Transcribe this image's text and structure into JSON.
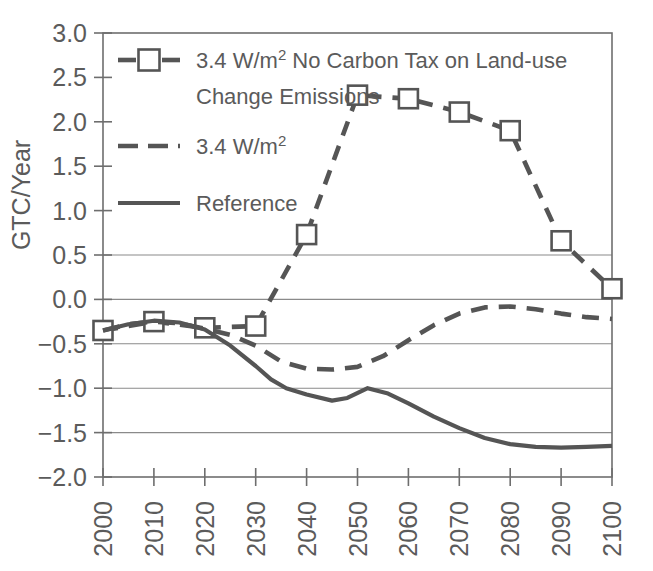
{
  "chart_data": {
    "type": "line",
    "title": "",
    "xlabel": "",
    "ylabel": "GTC/Year",
    "xlim": [
      2000,
      2100
    ],
    "ylim": [
      -2.0,
      3.0
    ],
    "grid": true,
    "legend_position": "top-left",
    "x": [
      2000,
      2010,
      2020,
      2030,
      2040,
      2050,
      2060,
      2070,
      2080,
      2090,
      2100
    ],
    "xtick_labels": [
      "2000",
      "2010",
      "2020",
      "2030",
      "2040",
      "2050",
      "2060",
      "2070",
      "2080",
      "2090",
      "2100"
    ],
    "ytick_labels": [
      "3.0",
      "2.5",
      "2.0",
      "1.5",
      "1.0",
      "0.5",
      "0.0",
      "−0.5",
      "−1.0",
      "−1.5",
      "−2.0"
    ],
    "ytick_values": [
      3.0,
      2.5,
      2.0,
      1.5,
      1.0,
      0.5,
      0.0,
      -0.5,
      -1.0,
      -1.5,
      -2.0
    ],
    "gridline_values": [
      0.5,
      0.0,
      -0.5,
      -1.0,
      -1.5
    ],
    "series": [
      {
        "name": "3.4 W/m2 No Carbon Tax on Land-use Change Emissions",
        "legend_line1": "3.4 W/m",
        "legend_sup1": "2",
        "legend_line1_rest": " No Carbon Tax on Land-use",
        "legend_line2": "Change Emissions",
        "style": "dashed-square",
        "color": "#555555",
        "marker": "square",
        "values": [
          -0.35,
          -0.25,
          -0.32,
          -0.3,
          0.73,
          2.3,
          2.26,
          2.11,
          1.9,
          0.66,
          0.12
        ]
      },
      {
        "name": "3.4 W/m2",
        "legend_line1": "3.4 W/m",
        "legend_sup1": "2",
        "legend_line1_rest": "",
        "legend_line2": "",
        "style": "dashed",
        "color": "#555555",
        "marker": "none",
        "values": [
          -0.35,
          -0.25,
          -0.32,
          -0.45,
          -0.78,
          -0.75,
          -0.5,
          -0.12,
          -0.09,
          -0.15,
          -0.22
        ]
      },
      {
        "name": "Reference",
        "legend_line1": "Reference",
        "legend_sup1": "",
        "legend_line1_rest": "",
        "legend_line2": "",
        "style": "solid",
        "color": "#555555",
        "marker": "none",
        "values": [
          -0.35,
          -0.24,
          -0.33,
          -1.0,
          -1.13,
          -1.0,
          -1.24,
          -1.48,
          -1.63,
          -1.66,
          -1.65
        ]
      }
    ],
    "series_detail": [
      {
        "name": "3.4 W/m2 No Carbon Tax on Land-use Change Emissions",
        "points": [
          {
            "x": 2000,
            "y": -0.35
          },
          {
            "x": 2010,
            "y": -0.25
          },
          {
            "x": 2020,
            "y": -0.32
          },
          {
            "x": 2030,
            "y": -0.3
          },
          {
            "x": 2040,
            "y": 0.73
          },
          {
            "x": 2050,
            "y": 2.3
          },
          {
            "x": 2060,
            "y": 2.26
          },
          {
            "x": 2070,
            "y": 2.11
          },
          {
            "x": 2080,
            "y": 1.9
          },
          {
            "x": 2090,
            "y": 0.66
          },
          {
            "x": 2100,
            "y": 0.12
          }
        ]
      },
      {
        "name": "3.4 W/m2",
        "points": [
          {
            "x": 2000,
            "y": -0.35
          },
          {
            "x": 2005,
            "y": -0.28
          },
          {
            "x": 2010,
            "y": -0.25
          },
          {
            "x": 2015,
            "y": -0.27
          },
          {
            "x": 2020,
            "y": -0.33
          },
          {
            "x": 2025,
            "y": -0.4
          },
          {
            "x": 2030,
            "y": -0.52
          },
          {
            "x": 2035,
            "y": -0.7
          },
          {
            "x": 2040,
            "y": -0.78
          },
          {
            "x": 2045,
            "y": -0.79
          },
          {
            "x": 2050,
            "y": -0.76
          },
          {
            "x": 2055,
            "y": -0.64
          },
          {
            "x": 2060,
            "y": -0.46
          },
          {
            "x": 2065,
            "y": -0.29
          },
          {
            "x": 2070,
            "y": -0.16
          },
          {
            "x": 2075,
            "y": -0.09
          },
          {
            "x": 2080,
            "y": -0.08
          },
          {
            "x": 2085,
            "y": -0.11
          },
          {
            "x": 2090,
            "y": -0.16
          },
          {
            "x": 2095,
            "y": -0.2
          },
          {
            "x": 2100,
            "y": -0.22
          }
        ]
      },
      {
        "name": "Reference",
        "points": [
          {
            "x": 2000,
            "y": -0.35
          },
          {
            "x": 2005,
            "y": -0.28
          },
          {
            "x": 2010,
            "y": -0.24
          },
          {
            "x": 2015,
            "y": -0.26
          },
          {
            "x": 2020,
            "y": -0.34
          },
          {
            "x": 2025,
            "y": -0.52
          },
          {
            "x": 2030,
            "y": -0.75
          },
          {
            "x": 2033,
            "y": -0.9
          },
          {
            "x": 2036,
            "y": -1.0
          },
          {
            "x": 2040,
            "y": -1.07
          },
          {
            "x": 2045,
            "y": -1.14
          },
          {
            "x": 2048,
            "y": -1.11
          },
          {
            "x": 2052,
            "y": -1.0
          },
          {
            "x": 2056,
            "y": -1.06
          },
          {
            "x": 2060,
            "y": -1.17
          },
          {
            "x": 2065,
            "y": -1.32
          },
          {
            "x": 2070,
            "y": -1.45
          },
          {
            "x": 2075,
            "y": -1.56
          },
          {
            "x": 2080,
            "y": -1.63
          },
          {
            "x": 2085,
            "y": -1.66
          },
          {
            "x": 2090,
            "y": -1.67
          },
          {
            "x": 2095,
            "y": -1.66
          },
          {
            "x": 2100,
            "y": -1.65
          }
        ]
      }
    ]
  },
  "axis": {
    "y_label": "GTC/Year"
  },
  "legend": {
    "entries": [
      {
        "key": "no-carbon-tax",
        "line1_pre": "3.4 W/m",
        "line1_sup": "2",
        "line1_post": " No Carbon Tax on Land-use",
        "line2": "Change Emissions",
        "swatch": "dashed-square"
      },
      {
        "key": "3p4-wm2",
        "line1_pre": "3.4 W/m",
        "line1_sup": "2",
        "line1_post": "",
        "line2": "",
        "swatch": "dashed"
      },
      {
        "key": "reference",
        "line1_pre": "Reference",
        "line1_sup": "",
        "line1_post": "",
        "line2": "",
        "swatch": "solid"
      }
    ]
  },
  "colors": {
    "line": "#555555",
    "grid": "#8a8a8a",
    "frame": "#6e6e6e",
    "text": "#5b5b5b"
  }
}
